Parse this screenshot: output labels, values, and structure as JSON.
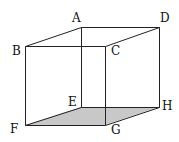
{
  "diagram": {
    "type": "cube",
    "shaded_face": [
      "E",
      "F",
      "G",
      "H"
    ],
    "shade_color": "#c8c8c8",
    "line_color": "#222222",
    "vertices": [
      {
        "label": "A",
        "x": 81,
        "y": 27,
        "lx": 72,
        "ly": 22
      },
      {
        "label": "B",
        "x": 25,
        "y": 46,
        "lx": 12,
        "ly": 55
      },
      {
        "label": "C",
        "x": 105,
        "y": 46,
        "lx": 111,
        "ly": 55
      },
      {
        "label": "D",
        "x": 159,
        "y": 27,
        "lx": 160,
        "ly": 22
      },
      {
        "label": "E",
        "x": 81,
        "y": 107,
        "lx": 68,
        "ly": 106
      },
      {
        "label": "F",
        "x": 25,
        "y": 125,
        "lx": 10,
        "ly": 133
      },
      {
        "label": "G",
        "x": 105,
        "y": 125,
        "lx": 111,
        "ly": 134
      },
      {
        "label": "H",
        "x": 159,
        "y": 107,
        "lx": 162,
        "ly": 110
      }
    ],
    "edges": [
      [
        "A",
        "B"
      ],
      [
        "A",
        "D"
      ],
      [
        "B",
        "C"
      ],
      [
        "C",
        "D"
      ],
      [
        "E",
        "F"
      ],
      [
        "E",
        "H"
      ],
      [
        "F",
        "G"
      ],
      [
        "G",
        "H"
      ],
      [
        "A",
        "E"
      ],
      [
        "B",
        "F"
      ],
      [
        "C",
        "G"
      ],
      [
        "D",
        "H"
      ]
    ]
  }
}
